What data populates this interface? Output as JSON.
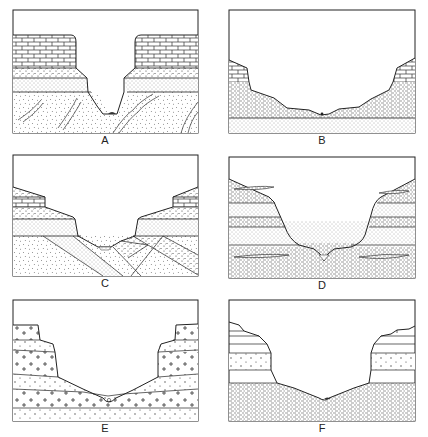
{
  "figure": {
    "line_color": "#222222",
    "background": "#ffffff",
    "panels": [
      {
        "id": "A",
        "label": "A",
        "features": [
          "limestone cap (brick pattern)",
          "coarse sandstone band",
          "fine sandstone band",
          "folded/dipping veins in basement",
          "V-shaped valley with small stream deposit"
        ]
      },
      {
        "id": "B",
        "label": "B",
        "features": [
          "limestone remnants at edges",
          "shale (dashed pattern) slopes",
          "fine sandstone base layer",
          "broad open valley"
        ]
      },
      {
        "id": "C",
        "label": "C",
        "features": [
          "horizontal caprock layers",
          "tilted (dipping) strata below unconformity",
          "valley floor with stream deposit"
        ]
      },
      {
        "id": "D",
        "label": "D",
        "features": [
          "interbedded shale and sandstone",
          "thin lenses",
          "U-shaped valley"
        ]
      },
      {
        "id": "E",
        "label": "E",
        "features": [
          "crystalline rock (plus-sign pattern) blocks",
          "stepped cliff walls",
          "valley with stream deposit"
        ]
      },
      {
        "id": "F",
        "label": "F",
        "features": [
          "stepped upper layers",
          "dotted crystalline band",
          "shale base",
          "wide valley floor"
        ]
      }
    ]
  }
}
